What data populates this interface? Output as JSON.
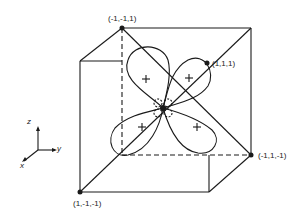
{
  "diagram": {
    "type": "orbital-cube",
    "corner_labels": {
      "top_back_left": "(-1,-1,1)",
      "front_top_right_point": "(1,1,1)",
      "bottom_front_left": "(1,-1,-1)",
      "bottom_back_right": "(-1,1,-1)"
    },
    "axes": {
      "z": "z",
      "y": "y",
      "x": "x"
    },
    "lobe_sign": "+",
    "center_sign": "-",
    "colors": {
      "line": "#1a1a1a",
      "background": "#ffffff"
    }
  }
}
